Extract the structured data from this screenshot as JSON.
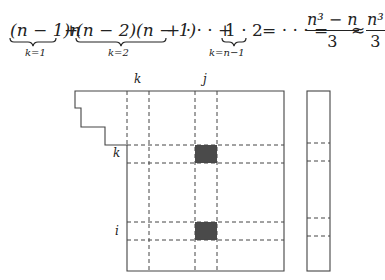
{
  "formula": {
    "term1": "(n − 1)n",
    "sub1": "k=1",
    "plus1": "+",
    "term2": "(n − 2)(n − 1)",
    "sub2": "k=2",
    "plus2": "+ · · · +",
    "term3": "1 · 2",
    "sub3": "k=n−1",
    "eq": "= · · · =",
    "frac1_num": "n³ − n",
    "frac1_den": "3",
    "approx": "≈",
    "frac2_num": "n³",
    "frac2_den": "3"
  },
  "diagram": {
    "labels": {
      "col_k": "k",
      "col_j": "j",
      "row_k": "k",
      "row_i": "i"
    },
    "highlight_color": "#4a4a4a",
    "line_color": "#444444"
  },
  "caption": "· · · · · · · · ·"
}
